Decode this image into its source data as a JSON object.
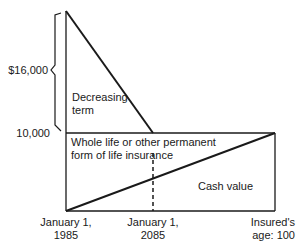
{
  "diagram": {
    "y_labels": {
      "top": "$16,000",
      "mid": "10,000"
    },
    "regions": {
      "decreasing_term": [
        "Decreasing",
        "term"
      ],
      "whole_life": [
        "Whole life or other permanent",
        "form of life insurance"
      ],
      "cash_value": "Cash value"
    },
    "x_labels": {
      "start": [
        "January 1,",
        "1985"
      ],
      "middle": [
        "January 1,",
        "2085"
      ],
      "end": [
        "Insured's",
        "age: 100"
      ]
    },
    "colors": {
      "line": "#1a1a1a",
      "background": "#ffffff"
    }
  }
}
